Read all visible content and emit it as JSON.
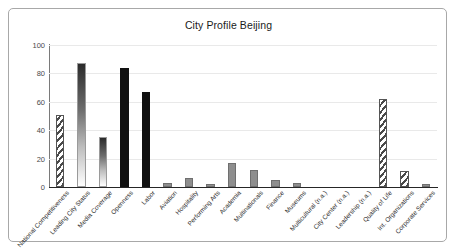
{
  "chart_data": {
    "type": "bar",
    "title": "City Profile Beijing",
    "xlabel": "",
    "ylabel": "",
    "ylim": [
      0,
      100
    ],
    "yticks": [
      0,
      20,
      40,
      60,
      80,
      100
    ],
    "grid": true,
    "legend": "none",
    "categories": [
      "National Competitiveness",
      "Leading City Status",
      "Media Coverage",
      "Openness",
      "Labor",
      "Aviation",
      "Hospitality",
      "Performing Arts",
      "Academia",
      "Multinationals",
      "Finance",
      "Museums",
      "Multicultural (n.a.)",
      "City Center (n.a.)",
      "Leadership (n.a.)",
      "Quality of Life",
      "Int. Organizations",
      "Corporate Services"
    ],
    "values": [
      51,
      87,
      35,
      84,
      67,
      3,
      6,
      2,
      17,
      12,
      5,
      3,
      0,
      0,
      0,
      62,
      11,
      2
    ],
    "bar_styles": [
      "hatch",
      "grad",
      "grad",
      "solid",
      "solid",
      "gray",
      "gray",
      "gray",
      "gray",
      "gray",
      "gray",
      "gray",
      "none",
      "none",
      "none",
      "hatch",
      "hatch",
      "gray"
    ]
  },
  "colors": {
    "frame_border": "#a8a8a8",
    "axis": "#262626",
    "grid": "#e9e9e9",
    "bar_solid": "#111111",
    "bar_gray": "#8e8e8e",
    "bar_hatch": "#4a4a4a",
    "text": "#1a1a1a"
  }
}
